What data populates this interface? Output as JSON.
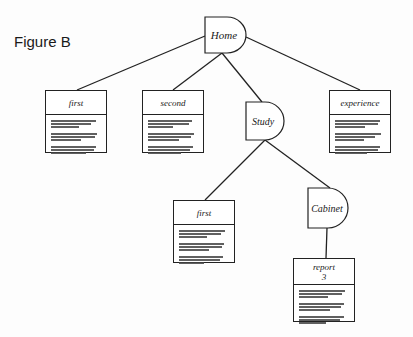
{
  "figure": {
    "label": "Figure B"
  },
  "colors": {
    "stroke": "#222222",
    "background": "#fdfdfd",
    "text": "#1a1a1a"
  },
  "nodes": {
    "home": {
      "type": "directory",
      "label": "Home"
    },
    "study": {
      "type": "directory",
      "label": "Study"
    },
    "cabinet": {
      "type": "directory",
      "label": "Cabinet"
    },
    "first": {
      "type": "document",
      "label": "first",
      "label2": ""
    },
    "second": {
      "type": "document",
      "label": "second",
      "label2": ""
    },
    "experience": {
      "type": "document",
      "label": "experience",
      "label2": ""
    },
    "first_study": {
      "type": "document",
      "label": "first",
      "label2": ""
    },
    "report": {
      "type": "document",
      "label": "report",
      "label2": "3"
    }
  },
  "edges": [
    [
      "home",
      "first"
    ],
    [
      "home",
      "second"
    ],
    [
      "home",
      "study"
    ],
    [
      "home",
      "experience"
    ],
    [
      "study",
      "first_study"
    ],
    [
      "study",
      "cabinet"
    ],
    [
      "cabinet",
      "report"
    ]
  ]
}
